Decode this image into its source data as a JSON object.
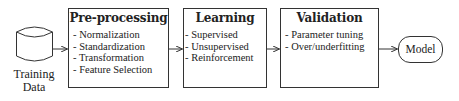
{
  "diagram": {
    "source": {
      "label_line1": "Training",
      "label_line2": "Data",
      "shape": "database-cylinder-icon"
    },
    "stages": [
      {
        "title": "Pre-processing",
        "items": [
          "Normalization",
          "Standardization",
          "Transformation",
          "Feature Selection"
        ]
      },
      {
        "title": "Learning",
        "items": [
          "Supervised",
          "Unsupervised",
          "Reinforcement"
        ]
      },
      {
        "title": "Validation",
        "items": [
          "Parameter tuning",
          "Over/underfitting"
        ]
      }
    ],
    "output": {
      "label": "Model"
    },
    "colors": {
      "stroke": "#333333",
      "text": "#222222",
      "background": "#ffffff"
    }
  }
}
